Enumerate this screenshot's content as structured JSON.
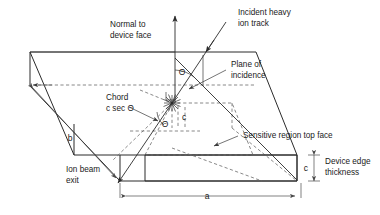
{
  "figure": {
    "background_color": "#ffffff",
    "line_color": "#2b2b2b",
    "hidden_line_color": "#6b6b6b",
    "text_color": "#1a1a1a"
  },
  "labels": {
    "normal_to_device_face_line1": "Normal to",
    "normal_to_device_face_line2": "device face",
    "incident_ion_track_line1": "Incident heavy",
    "incident_ion_track_line2": "ion track",
    "plane_of_incidence_line1": "Plane of",
    "plane_of_incidence_line2": "incidence",
    "chord_line1": "Chord",
    "chord_line2": "c sec Θ",
    "sensitive_region_top_face": "Sensitive region top face",
    "device_edge_thickness_line1": "Device edge",
    "device_edge_thickness_line2": "thickness",
    "ion_beam_exit_line1": "Ion beam",
    "ion_beam_exit_line2": "exit"
  },
  "symbols": {
    "theta_upper": "Θ",
    "theta_lower": "Θ",
    "dim_a": "a",
    "dim_b": "b",
    "dim_c_edge": "c",
    "dim_c_inner": "c"
  },
  "icons": {
    "incident_arrowhead": "arrowhead-icon",
    "normal_arrowhead": "arrowhead-icon",
    "ion_exit_arrowhead": "arrowhead-icon",
    "leader_arrowhead": "leader-arrowhead-icon",
    "dimension_arrowhead": "dimension-arrowhead-icon",
    "strike_point": "ion-strike-burst-icon"
  }
}
